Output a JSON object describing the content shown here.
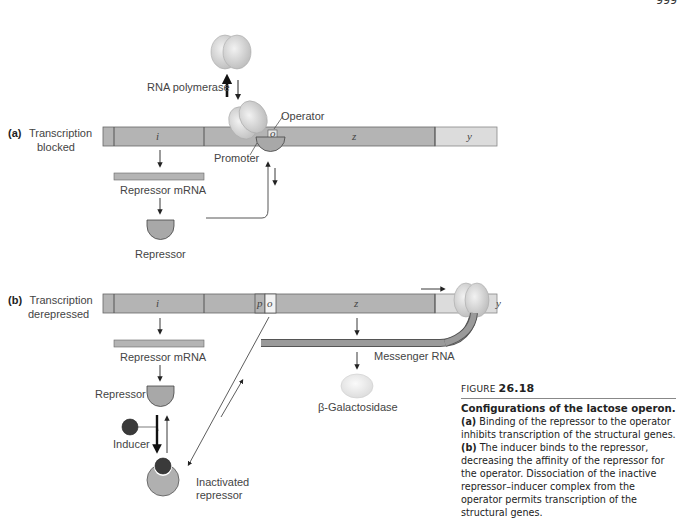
{
  "page_number": "999",
  "panel_a": {
    "label_bold": "(a)",
    "label_line1": "Transcription",
    "label_line2": "blocked",
    "genes": [
      "i",
      "o",
      "z",
      "y"
    ],
    "rna_polymerase": "RNA polymerase",
    "operator": "Operator",
    "promoter": "Promoter",
    "repressor_mrna": "Repressor mRNA",
    "repressor": "Repressor"
  },
  "panel_b": {
    "label_bold": "(b)",
    "label_line1": "Transcription",
    "label_line2": "derepressed",
    "genes": [
      "i",
      "p",
      "o",
      "z",
      "y"
    ],
    "repressor_mrna": "Repressor mRNA",
    "repressor": "Repressor",
    "inducer": "Inducer",
    "inactivated_line1": "Inactivated",
    "inactivated_line2": "repressor",
    "messenger_rna": "Messenger RNA",
    "beta_galactosidase": "β-Galactosidase"
  },
  "caption": {
    "figure_prefix": "FIGURE ",
    "figure_number": "26.18",
    "title": "Configurations of the lactose operon.",
    "part_a_label": "(a)",
    "part_a_text": " Binding of the repressor to the operator inhibits transcription of the structural genes.",
    "part_b_label": "(b)",
    "part_b_text": " The inducer binds to the repressor, decreasing the affinity of the repressor for the operator. Dissociation of the inactive repressor–inducer complex from the operator permits transcription of the structural genes."
  },
  "colors": {
    "dna_dark": "#b4b4b4",
    "dna_light": "#dcdcdc",
    "repressor": "#a8a8a8",
    "inducer": "#3a3a3a",
    "polymerase": "#d2d2d2",
    "mrna": "#9a9a9a"
  }
}
